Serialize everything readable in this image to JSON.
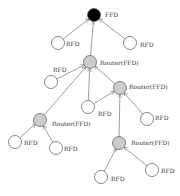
{
  "diagram": {
    "nodes": [
      {
        "id": "coord",
        "type": "coordinator",
        "label": "FFD"
      },
      {
        "id": "r0a",
        "type": "rfd",
        "label": "RFD"
      },
      {
        "id": "r0b",
        "type": "rfd",
        "label": "RFD"
      },
      {
        "id": "router1",
        "type": "router",
        "label": "Router(FFD)"
      },
      {
        "id": "r1a",
        "type": "rfd",
        "label": "RFD"
      },
      {
        "id": "router2",
        "type": "router",
        "label": "Router(FFD)"
      },
      {
        "id": "r2a",
        "type": "rfd",
        "label": "RFD"
      },
      {
        "id": "r2b",
        "type": "rfd",
        "label": "RFD"
      },
      {
        "id": "router3",
        "type": "router",
        "label": "Router(FFD)"
      },
      {
        "id": "r3a",
        "type": "rfd",
        "label": "RFD"
      },
      {
        "id": "r3b",
        "type": "rfd",
        "label": "RFD"
      },
      {
        "id": "router4",
        "type": "router",
        "label": "Router(FFD)"
      },
      {
        "id": "r4a",
        "type": "rfd",
        "label": "RFD"
      },
      {
        "id": "r4b",
        "type": "rfd",
        "label": "RFD"
      }
    ],
    "edges": [
      [
        "r0a",
        "coord"
      ],
      [
        "r0b",
        "coord"
      ],
      [
        "router1",
        "coord"
      ],
      [
        "r1a",
        "router1"
      ],
      [
        "router3",
        "router1"
      ],
      [
        "r2a",
        "router1"
      ],
      [
        "router2",
        "router1"
      ],
      [
        "r2a",
        "router2"
      ],
      [
        "r2b",
        "router2"
      ],
      [
        "router4",
        "router2"
      ],
      [
        "r3a",
        "router3"
      ],
      [
        "r3b",
        "router3"
      ],
      [
        "r4a",
        "router4"
      ],
      [
        "r4b",
        "router4"
      ]
    ],
    "colors": {
      "coordinator": "#000000",
      "router": "#cccccc",
      "rfd": "#ffffff"
    }
  }
}
